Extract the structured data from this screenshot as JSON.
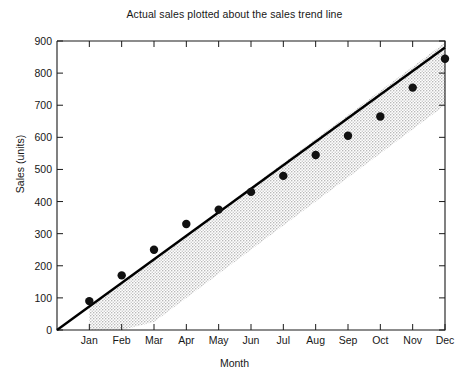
{
  "chart_data": {
    "type": "scatter",
    "title": "Actual sales plotted about the sales trend line",
    "xlabel": "Month",
    "ylabel": "Sales (units)",
    "categories": [
      "Jan",
      "Feb",
      "Mar",
      "Apr",
      "May",
      "Jun",
      "Jul",
      "Aug",
      "Sep",
      "Oct",
      "Nov",
      "Dec"
    ],
    "values": [
      90,
      170,
      250,
      330,
      375,
      430,
      480,
      545,
      605,
      665,
      755,
      845
    ],
    "series": [
      {
        "name": "Actual sales",
        "type": "scatter",
        "values": [
          90,
          170,
          250,
          330,
          375,
          430,
          480,
          545,
          605,
          665,
          755,
          845
        ]
      },
      {
        "name": "Sales trend line",
        "type": "line",
        "x": [
          0,
          12
        ],
        "y": [
          0,
          880
        ]
      },
      {
        "name": "Trend band",
        "type": "area",
        "upper": [
          75,
          145,
          220,
          295,
          370,
          445,
          520,
          595,
          670,
          745,
          820,
          895
        ],
        "lower": [
          0,
          0,
          25,
          100,
          175,
          250,
          325,
          400,
          475,
          550,
          625,
          700
        ]
      }
    ],
    "ylim": [
      0,
      900
    ],
    "ytick_values": [
      0,
      100,
      200,
      300,
      400,
      500,
      600,
      700,
      800,
      900
    ],
    "ytick_labels": [
      "0",
      "100",
      "200",
      "300",
      "400",
      "500",
      "600",
      "700",
      "800",
      "900"
    ],
    "xlim": [
      0,
      12
    ],
    "grid": false,
    "legend": "none",
    "colors": {
      "marker": "#111111",
      "trend_line": "#000000",
      "band_fill": "#d6d6d6",
      "axis": "#1a1a1a",
      "background": "#ffffff"
    }
  }
}
